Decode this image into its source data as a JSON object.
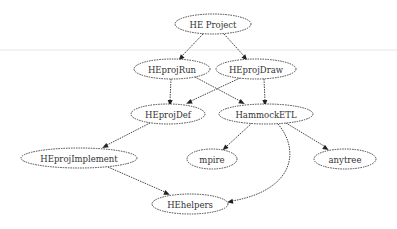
{
  "diagram": {
    "type": "directed-graph",
    "nodes": [
      {
        "id": "he_project",
        "label": "HE Project",
        "cx": 213,
        "cy": 24,
        "rx": 38,
        "ry": 10
      },
      {
        "id": "heprojrun",
        "label": "HEprojRun",
        "cx": 172,
        "cy": 69,
        "rx": 38,
        "ry": 10
      },
      {
        "id": "heprojdraw",
        "label": "HEprojDraw",
        "cx": 256,
        "cy": 69,
        "rx": 40,
        "ry": 10
      },
      {
        "id": "heprojdef",
        "label": "HEprojDef",
        "cx": 168,
        "cy": 114,
        "rx": 37,
        "ry": 10
      },
      {
        "id": "hammocketl",
        "label": "HammockETL",
        "cx": 266,
        "cy": 114,
        "rx": 47,
        "ry": 10
      },
      {
        "id": "heprojimplement",
        "label": "HEprojImplement",
        "cx": 79,
        "cy": 158,
        "rx": 58,
        "ry": 10
      },
      {
        "id": "mpire",
        "label": "mpire",
        "cx": 212,
        "cy": 159,
        "rx": 25,
        "ry": 10
      },
      {
        "id": "anytree",
        "label": "anytree",
        "cx": 345,
        "cy": 159,
        "rx": 31,
        "ry": 10
      },
      {
        "id": "hehelpers",
        "label": "HEhelpers",
        "cx": 190,
        "cy": 204,
        "rx": 38,
        "ry": 10
      }
    ],
    "edges": [
      {
        "from": "HE Project",
        "to": "HEprojRun",
        "path": "M203,34 L182,56",
        "arrow": "180,59"
      },
      {
        "from": "HE Project",
        "to": "HEprojDraw",
        "path": "M224,34 L244,56",
        "arrow": "246,59"
      },
      {
        "from": "HEprojRun",
        "to": "HEprojDef",
        "path": "M171,79 L170,101",
        "arrow": "170,104"
      },
      {
        "from": "HEprojRun",
        "to": "HammockETL",
        "path": "M195,77 L240,101",
        "arrow": "243,103"
      },
      {
        "from": "HEprojDraw",
        "to": "HEprojDef",
        "path": "M240,78 L191,101",
        "arrow": "188,103"
      },
      {
        "from": "HEprojDraw",
        "to": "HammockETL",
        "path": "M264,79 L265,101",
        "arrow": "265,104"
      },
      {
        "from": "HEprojDef",
        "to": "HEprojImplement",
        "path": "M150,123 L107,145",
        "arrow": "104,147"
      },
      {
        "from": "HammockETL",
        "to": "mpire",
        "path": "M252,123 L227,146",
        "arrow": "224,149"
      },
      {
        "from": "HammockETL",
        "to": "anytree",
        "path": "M286,123 L324,146",
        "arrow": "327,149"
      },
      {
        "from": "HammockETL",
        "to": "HEhelpers",
        "path": "M278,124 C300,150 295,190 232,201",
        "arrow": "229,202"
      },
      {
        "from": "HEprojImplement",
        "to": "HEhelpers",
        "path": "M108,167 L165,192",
        "arrow": "168,194"
      }
    ]
  }
}
